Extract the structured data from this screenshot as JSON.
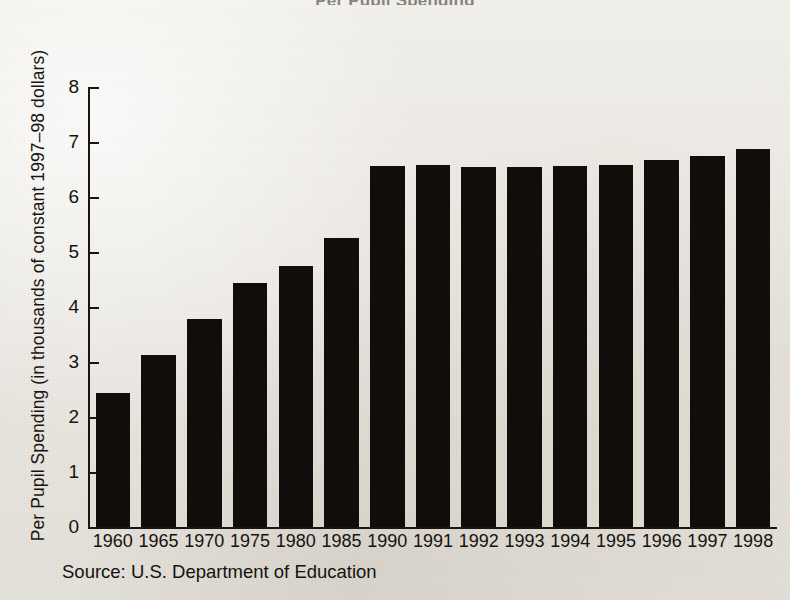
{
  "figure": {
    "clipped_title": "Per Pupil Spending",
    "source_note": "Source: U.S. Department of Education"
  },
  "chart_data": {
    "type": "bar",
    "title": "Per Pupil Spending",
    "xlabel": "",
    "ylabel": "Per Pupil Spending (in thousands of constant 1997–98 dollars)",
    "categories": [
      "1960",
      "1965",
      "1970",
      "1975",
      "1980",
      "1985",
      "1990",
      "1991",
      "1992",
      "1993",
      "1994",
      "1995",
      "1996",
      "1997",
      "1998"
    ],
    "values": [
      2.43,
      3.12,
      3.78,
      4.44,
      4.74,
      5.25,
      6.57,
      6.59,
      6.55,
      6.55,
      6.57,
      6.59,
      6.68,
      6.75,
      6.87
    ],
    "ylim": [
      0,
      8
    ],
    "yticks": [
      "0",
      "1",
      "2",
      "3",
      "4",
      "5",
      "6",
      "7",
      "8"
    ],
    "grid": false,
    "legend": "none",
    "bar_color": "#100d0b"
  }
}
